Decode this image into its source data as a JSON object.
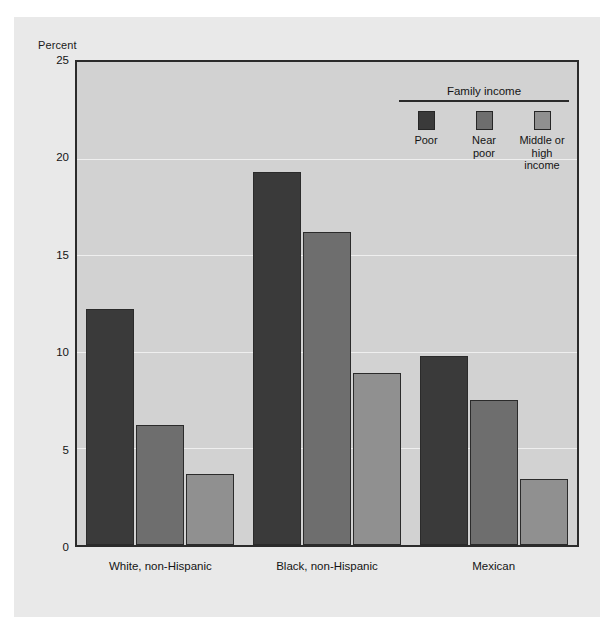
{
  "chart_data": {
    "type": "bar",
    "title": "",
    "xlabel": "",
    "ylabel": "Percent",
    "ylim": [
      0,
      25
    ],
    "yticks": [
      25,
      20,
      15,
      10,
      5,
      0
    ],
    "grid": true,
    "categories": [
      "White, non-Hispanic",
      "Black, non-Hispanic",
      "Mexican"
    ],
    "legend_title": "Family income",
    "legend_position": "top-right inside plot",
    "series": [
      {
        "name": "Poor",
        "values": [
          12.2,
          19.3,
          9.8
        ],
        "color": "#3a3a3a"
      },
      {
        "name": "Near poor",
        "values": [
          6.2,
          16.2,
          7.5
        ],
        "color": "#6e6e6e"
      },
      {
        "name": "Middle or high income",
        "values": [
          3.7,
          8.9,
          3.4
        ],
        "color": "#909090"
      }
    ]
  },
  "legend": {
    "title": "Family income",
    "items": [
      {
        "label": "Poor",
        "color": "#3a3a3a"
      },
      {
        "label": "Near\npoor",
        "color": "#6e6e6e"
      },
      {
        "label": "Middle or\nhigh income",
        "color": "#909090"
      }
    ]
  },
  "axis": {
    "y_title": "Percent",
    "y_ticks": [
      "25",
      "20",
      "15",
      "10",
      "5",
      "0"
    ],
    "x_labels": [
      "White, non-Hispanic",
      "Black, non-Hispanic",
      "Mexican"
    ]
  },
  "colors": {
    "panel": "#d2d2d2",
    "figure": "#e9e9e9",
    "axis": "#2b2b2b",
    "gridline": "#efefef"
  }
}
